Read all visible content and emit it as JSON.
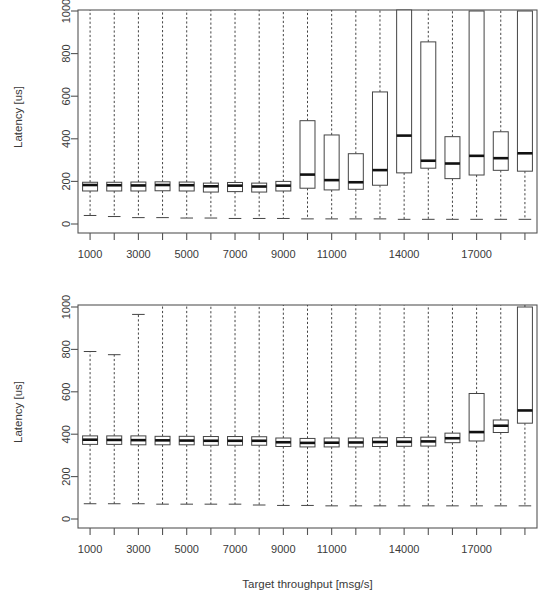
{
  "figure": {
    "panels": [
      {
        "id": "top-panel",
        "ylabel": "Latency [us]",
        "xlabel": "",
        "ylim": [
          0,
          1000
        ],
        "yticks": [
          0,
          200,
          400,
          600,
          800,
          1000
        ],
        "xtick_labels": [
          "1000",
          "",
          "3000",
          "",
          "5000",
          "",
          "7000",
          "",
          "9000",
          "",
          "11000",
          "",
          "",
          "14000",
          "",
          "",
          "17000",
          "",
          ""
        ]
      },
      {
        "id": "bottom-panel",
        "ylabel": "Latency [us]",
        "xlabel": "Target throughput [msg/s]",
        "ylim": [
          0,
          1000
        ],
        "yticks": [
          0,
          200,
          400,
          600,
          800,
          1000
        ],
        "xtick_labels": [
          "1000",
          "",
          "3000",
          "",
          "5000",
          "",
          "7000",
          "",
          "9000",
          "",
          "11000",
          "",
          "",
          "14000",
          "",
          "",
          "17000",
          "",
          ""
        ]
      }
    ]
  },
  "chart_data": [
    {
      "type": "box",
      "id": "top-panel",
      "title": "",
      "xlabel": "",
      "ylabel": "Latency [us]",
      "ylim": [
        0,
        1000
      ],
      "yticks": [
        0,
        200,
        400,
        600,
        800,
        1000
      ],
      "grid": false,
      "legend": "none",
      "categories": [
        "1000",
        "2000",
        "3000",
        "4000",
        "5000",
        "6000",
        "7000",
        "8000",
        "9000",
        "10000",
        "11000",
        "12000",
        "13000",
        "14000",
        "15000",
        "16000",
        "17000",
        "18000",
        "19000"
      ],
      "boxes": [
        {
          "category": "1000",
          "lower_whisker": 40,
          "q1": 155,
          "median": 183,
          "q3": 196,
          "upper_whisker": 1000,
          "whisker_clipped_top": true
        },
        {
          "category": "2000",
          "lower_whisker": 35,
          "q1": 155,
          "median": 182,
          "q3": 196,
          "upper_whisker": 1000,
          "whisker_clipped_top": true
        },
        {
          "category": "3000",
          "lower_whisker": 30,
          "q1": 155,
          "median": 181,
          "q3": 197,
          "upper_whisker": 1000,
          "whisker_clipped_top": true
        },
        {
          "category": "4000",
          "lower_whisker": 30,
          "q1": 156,
          "median": 183,
          "q3": 198,
          "upper_whisker": 1000,
          "whisker_clipped_top": true
        },
        {
          "category": "5000",
          "lower_whisker": 28,
          "q1": 155,
          "median": 182,
          "q3": 197,
          "upper_whisker": 1000,
          "whisker_clipped_top": true
        },
        {
          "category": "6000",
          "lower_whisker": 28,
          "q1": 150,
          "median": 177,
          "q3": 192,
          "upper_whisker": 1000,
          "whisker_clipped_top": true
        },
        {
          "category": "7000",
          "lower_whisker": 26,
          "q1": 152,
          "median": 180,
          "q3": 195,
          "upper_whisker": 1000,
          "whisker_clipped_top": true
        },
        {
          "category": "8000",
          "lower_whisker": 26,
          "q1": 150,
          "median": 176,
          "q3": 192,
          "upper_whisker": 1000,
          "whisker_clipped_top": true
        },
        {
          "category": "9000",
          "lower_whisker": 26,
          "q1": 155,
          "median": 180,
          "q3": 200,
          "upper_whisker": 1000,
          "whisker_clipped_top": true
        },
        {
          "category": "10000",
          "lower_whisker": 24,
          "q1": 168,
          "median": 232,
          "q3": 485,
          "upper_whisker": 1000,
          "whisker_clipped_top": true
        },
        {
          "category": "11000",
          "lower_whisker": 24,
          "q1": 160,
          "median": 206,
          "q3": 418,
          "upper_whisker": 1000,
          "whisker_clipped_top": true
        },
        {
          "category": "12000",
          "lower_whisker": 24,
          "q1": 163,
          "median": 196,
          "q3": 330,
          "upper_whisker": 1000,
          "whisker_clipped_top": true
        },
        {
          "category": "13000",
          "lower_whisker": 24,
          "q1": 182,
          "median": 253,
          "q3": 620,
          "upper_whisker": 1000,
          "whisker_clipped_top": true
        },
        {
          "category": "14000",
          "lower_whisker": 22,
          "q1": 240,
          "median": 415,
          "q3": 1010,
          "upper_whisker": 1000,
          "whisker_clipped_top": true
        },
        {
          "category": "15000",
          "lower_whisker": 22,
          "q1": 262,
          "median": 297,
          "q3": 855,
          "upper_whisker": 1000,
          "whisker_clipped_top": true
        },
        {
          "category": "16000",
          "lower_whisker": 22,
          "q1": 213,
          "median": 284,
          "q3": 410,
          "upper_whisker": 1000,
          "whisker_clipped_top": true
        },
        {
          "category": "17000",
          "lower_whisker": 22,
          "q1": 230,
          "median": 320,
          "q3": 1000,
          "upper_whisker": 1000,
          "whisker_clipped_top": true
        },
        {
          "category": "18000",
          "lower_whisker": 22,
          "q1": 252,
          "median": 309,
          "q3": 433,
          "upper_whisker": 1000,
          "whisker_clipped_top": true
        },
        {
          "category": "19000",
          "lower_whisker": 22,
          "q1": 248,
          "median": 332,
          "q3": 1000,
          "upper_whisker": 1000,
          "whisker_clipped_top": true
        }
      ]
    },
    {
      "type": "box",
      "id": "bottom-panel",
      "title": "",
      "xlabel": "Target throughput [msg/s]",
      "ylabel": "Latency [us]",
      "ylim": [
        0,
        1000
      ],
      "yticks": [
        0,
        200,
        400,
        600,
        800,
        1000
      ],
      "grid": false,
      "legend": "none",
      "categories": [
        "1000",
        "2000",
        "3000",
        "4000",
        "5000",
        "6000",
        "7000",
        "8000",
        "9000",
        "10000",
        "11000",
        "12000",
        "13000",
        "14000",
        "15000",
        "16000",
        "17000",
        "18000",
        "19000"
      ],
      "boxes": [
        {
          "category": "1000",
          "lower_whisker": 72,
          "q1": 352,
          "median": 374,
          "q3": 392,
          "upper_whisker": 790,
          "whisker_clipped_top": false
        },
        {
          "category": "2000",
          "lower_whisker": 72,
          "q1": 352,
          "median": 373,
          "q3": 392,
          "upper_whisker": 775,
          "whisker_clipped_top": false
        },
        {
          "category": "3000",
          "lower_whisker": 72,
          "q1": 350,
          "median": 372,
          "q3": 392,
          "upper_whisker": 965,
          "whisker_clipped_top": false
        },
        {
          "category": "4000",
          "lower_whisker": 70,
          "q1": 350,
          "median": 371,
          "q3": 390,
          "upper_whisker": 1000,
          "whisker_clipped_top": true
        },
        {
          "category": "5000",
          "lower_whisker": 70,
          "q1": 350,
          "median": 370,
          "q3": 390,
          "upper_whisker": 1000,
          "whisker_clipped_top": true
        },
        {
          "category": "6000",
          "lower_whisker": 70,
          "q1": 348,
          "median": 369,
          "q3": 389,
          "upper_whisker": 1000,
          "whisker_clipped_top": true
        },
        {
          "category": "7000",
          "lower_whisker": 70,
          "q1": 348,
          "median": 369,
          "q3": 389,
          "upper_whisker": 1000,
          "whisker_clipped_top": true
        },
        {
          "category": "8000",
          "lower_whisker": 66,
          "q1": 348,
          "median": 369,
          "q3": 388,
          "upper_whisker": 1000,
          "whisker_clipped_top": true
        },
        {
          "category": "9000",
          "lower_whisker": 64,
          "q1": 342,
          "median": 362,
          "q3": 382,
          "upper_whisker": 1000,
          "whisker_clipped_top": true
        },
        {
          "category": "10000",
          "lower_whisker": 64,
          "q1": 340,
          "median": 359,
          "q3": 380,
          "upper_whisker": 1000,
          "whisker_clipped_top": true
        },
        {
          "category": "11000",
          "lower_whisker": 62,
          "q1": 340,
          "median": 360,
          "q3": 382,
          "upper_whisker": 1000,
          "whisker_clipped_top": true
        },
        {
          "category": "12000",
          "lower_whisker": 62,
          "q1": 340,
          "median": 361,
          "q3": 382,
          "upper_whisker": 1000,
          "whisker_clipped_top": true
        },
        {
          "category": "13000",
          "lower_whisker": 62,
          "q1": 342,
          "median": 363,
          "q3": 383,
          "upper_whisker": 1000,
          "whisker_clipped_top": true
        },
        {
          "category": "14000",
          "lower_whisker": 62,
          "q1": 343,
          "median": 364,
          "q3": 384,
          "upper_whisker": 1000,
          "whisker_clipped_top": true
        },
        {
          "category": "15000",
          "lower_whisker": 62,
          "q1": 344,
          "median": 366,
          "q3": 386,
          "upper_whisker": 1000,
          "whisker_clipped_top": true
        },
        {
          "category": "16000",
          "lower_whisker": 62,
          "q1": 360,
          "median": 381,
          "q3": 405,
          "upper_whisker": 1000,
          "whisker_clipped_top": true
        },
        {
          "category": "17000",
          "lower_whisker": 62,
          "q1": 368,
          "median": 410,
          "q3": 592,
          "upper_whisker": 1000,
          "whisker_clipped_top": true
        },
        {
          "category": "18000",
          "lower_whisker": 62,
          "q1": 408,
          "median": 440,
          "q3": 467,
          "upper_whisker": 1000,
          "whisker_clipped_top": true
        },
        {
          "category": "19000",
          "lower_whisker": 62,
          "q1": 452,
          "median": 512,
          "q3": 1000,
          "upper_whisker": 1000,
          "whisker_clipped_top": true
        }
      ]
    }
  ]
}
